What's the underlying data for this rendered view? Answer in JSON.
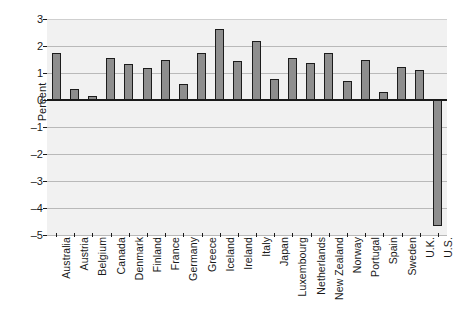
{
  "chart_data": {
    "type": "bar",
    "title": "",
    "subtitle": "",
    "xlabel": "",
    "ylabel": "Percent",
    "ylim": [
      -5,
      3
    ],
    "ytick_labels": [
      "3",
      "2",
      "1",
      "0",
      "–1",
      "–2",
      "–3",
      "–4",
      "–5"
    ],
    "ytick_values": [
      3,
      2,
      1,
      0,
      -1,
      -2,
      -3,
      -4,
      -5
    ],
    "grid": true,
    "legend": "none",
    "bar_color": "#8e8e8e",
    "bar_edge_color": "#1c1c1c",
    "plot_background": "#f1f1f1",
    "gridline_color": "#b9b9b9",
    "axis_color": "#1a1a1a",
    "categories": [
      "Australia",
      "Austria",
      "Belgium",
      "Canada",
      "Denmark",
      "Finland",
      "France",
      "Germany",
      "Greece",
      "Iceland",
      "Ireland",
      "Italy",
      "Japan",
      "Luxembourg",
      "Netherlands",
      "New Zealand",
      "Norway",
      "Portugal",
      "Spain",
      "Sweden",
      "U.K.",
      "U.S."
    ],
    "values": [
      1.75,
      0.42,
      0.15,
      1.55,
      1.33,
      1.17,
      1.47,
      0.58,
      1.75,
      2.62,
      1.45,
      2.2,
      0.78,
      1.55,
      1.38,
      1.73,
      0.72,
      1.5,
      0.3,
      1.22,
      1.12,
      -4.67
    ]
  }
}
